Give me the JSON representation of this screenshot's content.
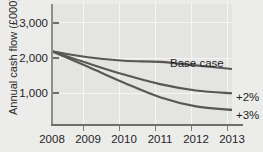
{
  "chart_data": {
    "type": "line",
    "title": "",
    "xlabel": "",
    "ylabel": "Annual cash flow (£000)",
    "x": [
      2008,
      2009,
      2010,
      2011,
      2012,
      2013
    ],
    "xtick_labels": [
      "2008",
      "2009",
      "2010",
      "2011",
      "2012",
      "2013"
    ],
    "ytick_labels": [
      "1,000",
      "2,000",
      "3,000"
    ],
    "ytick_values": [
      1000,
      2000,
      3000
    ],
    "xlim": [
      2008,
      2013
    ],
    "ylim": [
      0,
      3400
    ],
    "grid": true,
    "legend_position": "inline-right",
    "series": [
      {
        "name": "Base case",
        "values": [
          2060,
          1890,
          1790,
          1760,
          1660,
          1560
        ],
        "color": "#575756"
      },
      {
        "name": "+2%",
        "values": [
          2060,
          1720,
          1400,
          1130,
          950,
          870
        ],
        "color": "#575756"
      },
      {
        "name": "+3%",
        "values": [
          2060,
          1620,
          1170,
          760,
          500,
          400
        ],
        "color": "#575756"
      }
    ],
    "annotations": [
      {
        "text": "Base case",
        "series": "Base case"
      },
      {
        "text": "+2%",
        "series": "+2%"
      },
      {
        "text": "+3%",
        "series": "+3%"
      }
    ]
  }
}
